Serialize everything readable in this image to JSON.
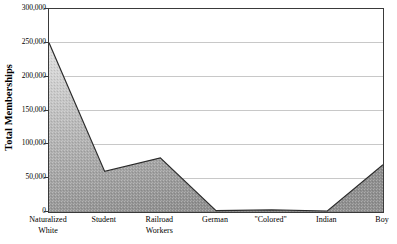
{
  "chart_data": {
    "type": "area",
    "title": "",
    "xlabel": "",
    "ylabel": "Total Memberships",
    "categories": [
      "Naturalized\nWhite",
      "Student",
      "Railroad\nWorkers",
      "German",
      "\"Colored\"",
      "Indian",
      "Boy"
    ],
    "values": [
      250000,
      60000,
      80000,
      2000,
      3000,
      1500,
      70000
    ],
    "ylim": [
      0,
      300000
    ],
    "ytick_values": [
      0,
      50000,
      100000,
      150000,
      200000,
      250000,
      300000
    ],
    "ytick_labels": [
      "0",
      "50,000",
      "100,000",
      "150,000",
      "200,000",
      "250,000",
      "300,000"
    ],
    "grid": true,
    "legend": "none",
    "fill_color": "#9a9a9a",
    "line_color": "#2b2b2b",
    "grid_color": "#c8c8c8",
    "axis_color": "#3a3a3a",
    "background_color": "#ffffff"
  },
  "axis": {
    "y_title": "Total Memberships"
  },
  "x_labels": [
    {
      "line1": "Naturalized",
      "line2": "White"
    },
    {
      "line1": "Student",
      "line2": ""
    },
    {
      "line1": "Railroad",
      "line2": "Workers"
    },
    {
      "line1": "German",
      "line2": ""
    },
    {
      "line1": "\"Colored\"",
      "line2": ""
    },
    {
      "line1": "Indian",
      "line2": ""
    },
    {
      "line1": "Boy",
      "line2": ""
    }
  ]
}
